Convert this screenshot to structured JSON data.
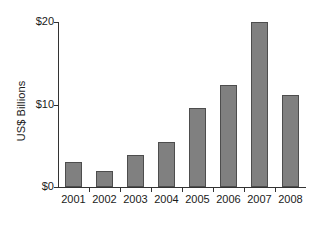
{
  "chart_data": {
    "type": "bar",
    "title": "",
    "xlabel": "",
    "ylabel": "US$ Billions",
    "categories": [
      "2001",
      "2002",
      "2003",
      "2004",
      "2005",
      "2006",
      "2007",
      "2008"
    ],
    "values": [
      3.0,
      2.0,
      3.9,
      5.5,
      9.6,
      12.4,
      20.0,
      11.1
    ],
    "ylim": [
      0,
      20
    ],
    "ytick_values": [
      0,
      10,
      20
    ],
    "ytick_labels": [
      "$0",
      "$10",
      "$20"
    ],
    "grid": false,
    "legend": null,
    "series": [
      {
        "name": "US$ Billions",
        "values": [
          3.0,
          2.0,
          3.9,
          5.5,
          9.6,
          12.4,
          20.0,
          11.1
        ]
      }
    ],
    "bar_color": "#808080",
    "bar_edge_color": "#4d4d4d",
    "axis_color": "#333333",
    "background_color": "#ffffff"
  }
}
